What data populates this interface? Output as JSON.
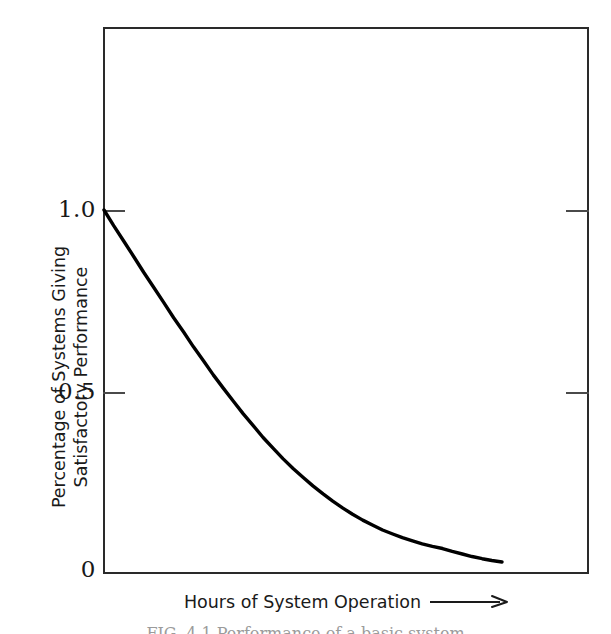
{
  "chart_data": {
    "type": "line",
    "title": "",
    "xlabel": "Hours of System Operation",
    "ylabel_line1": "Percentage of Systems Giving",
    "ylabel_line2": "Satisfactory Performance",
    "ylim": [
      0,
      1.35
    ],
    "xlim": [
      0,
      1
    ],
    "grid": false,
    "legend": null,
    "y_ticks": [
      "1.0",
      "0.5",
      "0"
    ],
    "y_tick_values": [
      1.0,
      0.5,
      0
    ],
    "x_ticks": [],
    "x_axis_arrow": "⟶",
    "series": [
      {
        "name": "Satisfactory performance decay",
        "x": [
          0.0,
          0.02,
          0.041,
          0.062,
          0.082,
          0.103,
          0.124,
          0.144,
          0.165,
          0.185,
          0.206,
          0.226,
          0.247,
          0.268,
          0.288,
          0.309,
          0.329,
          0.35,
          0.37,
          0.391,
          0.412,
          0.432,
          0.453,
          0.473,
          0.494,
          0.514,
          0.535,
          0.556,
          0.576,
          0.597,
          0.617,
          0.638,
          0.658,
          0.679,
          0.7,
          0.72,
          0.741,
          0.761,
          0.782,
          0.802,
          0.823
        ],
        "y": [
          1.0,
          0.957,
          0.914,
          0.871,
          0.829,
          0.787,
          0.745,
          0.704,
          0.664,
          0.624,
          0.585,
          0.547,
          0.51,
          0.474,
          0.44,
          0.407,
          0.375,
          0.345,
          0.317,
          0.29,
          0.265,
          0.242,
          0.22,
          0.2,
          0.181,
          0.164,
          0.148,
          0.134,
          0.121,
          0.11,
          0.1,
          0.091,
          0.083,
          0.076,
          0.07,
          0.062,
          0.055,
          0.048,
          0.042,
          0.037,
          0.033
        ]
      }
    ],
    "annotations": []
  },
  "axis": {
    "tick_1": "1.0",
    "tick_05": "0.5",
    "tick_0": "0"
  },
  "ylabel": {
    "line1": "Percentage of Systems Giving",
    "line2": "Satisfactory Performance"
  },
  "xlabel": {
    "text": "Hours of System Operation",
    "arrow": "⟶"
  },
  "caption": {
    "text": "FIG. 4.1  Performance of a basic system"
  }
}
